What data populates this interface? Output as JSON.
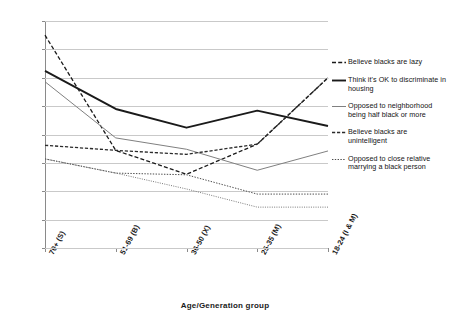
{
  "chart_data": {
    "type": "line",
    "title": "",
    "xlabel": "Age/Generation group",
    "ylabel": "",
    "ylim": [
      0,
      40
    ],
    "ystep": 5,
    "grid": true,
    "legend_position": "right",
    "categories": [
      "70+ (S)",
      "51-69 (B)",
      "36-50 (X)",
      "25-35 (M)",
      "18-24 (I & M)"
    ],
    "yticks": [
      "0",
      "5",
      "10",
      "15",
      "20",
      "25",
      "30",
      "35",
      "40"
    ],
    "series": [
      {
        "name": "Believe blacks are lazy",
        "style": "dashed",
        "color": "#1a1a1a",
        "values": [
          37.5,
          17.2,
          13.0,
          18.3,
          30.0
        ]
      },
      {
        "name": "Think it's OK to discriminate in housing",
        "style": "solid-thick",
        "color": "#1a1a1a",
        "values": [
          31.2,
          24.5,
          21.2,
          24.2,
          21.5
        ]
      },
      {
        "name": "Opposed to neighborhood being half black or more",
        "style": "solid-thin",
        "color": "#808080",
        "values": [
          29.3,
          19.4,
          17.4,
          13.7,
          17.1
        ]
      },
      {
        "name": "Believe blacks are unintelligent",
        "style": "dashed-medium",
        "color": "#2b2b2b",
        "values": [
          18.1,
          17.2,
          16.5,
          18.3,
          30.0
        ]
      },
      {
        "name": "Opposed to close relative marrying a black person",
        "style": "dotted",
        "color": "#4d4d4d",
        "values": [
          15.7,
          13.2,
          12.9,
          9.5,
          9.5
        ]
      }
    ],
    "series_extra": [
      {
        "name": "Opposed to close relative marrying a black person (lower)",
        "style": "dotted-fine",
        "color": "#6b6b6b",
        "values": [
          15.7,
          13.2,
          10.4,
          7.2,
          7.2
        ]
      }
    ]
  },
  "legend": {
    "entries": [
      {
        "label": "Believe blacks are lazy",
        "swatch": "dashed"
      },
      {
        "label": "Think it's OK to discriminate in housing",
        "swatch": "solid-thick"
      },
      {
        "label": "Opposed to neighborhood being half black or more",
        "swatch": "solid-thin"
      },
      {
        "label": "Believe blacks are unintelligent",
        "swatch": "dashed-medium"
      },
      {
        "label": "Opposed to close relative marrying a black person",
        "swatch": "dotted"
      }
    ]
  },
  "axis": {
    "x_title": "Age/Generation group"
  }
}
